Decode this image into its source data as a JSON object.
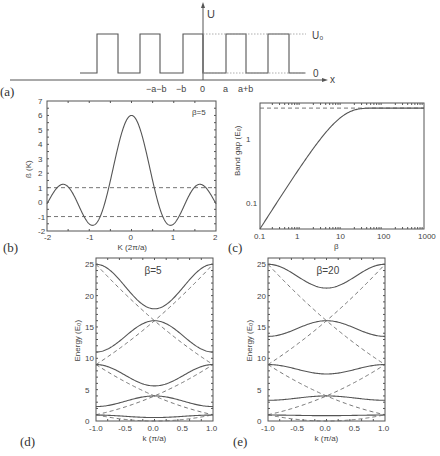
{
  "panels": {
    "a": {
      "label": "(a)",
      "y_axis_label": "U",
      "x_axis_label": "x",
      "level_high": "U₀",
      "level_low": "0",
      "x_ticks": [
        "−a−b",
        "−b",
        "0",
        "a",
        "a+b"
      ]
    },
    "b": {
      "label": "(b)"
    },
    "c": {
      "label": "(c)"
    },
    "d": {
      "label": "(d)"
    },
    "e": {
      "label": "(e)"
    }
  },
  "chart_data": [
    {
      "id": "a",
      "type": "line",
      "title": "",
      "description": "Periodic square-well (Kronig-Penney) potential U(x)",
      "xlabel": "x",
      "ylabel": "U",
      "x_ticks": [
        "-a-b",
        "-b",
        "0",
        "a",
        "a+b"
      ],
      "levels": {
        "low": "0",
        "high": "U0"
      }
    },
    {
      "id": "b",
      "type": "line",
      "annotation": "β=5",
      "xlabel": "K  (2π/a)",
      "ylabel": "ß (K)",
      "xlim": [
        -2,
        2
      ],
      "ylim": [
        -2,
        7
      ],
      "x_ticks": [
        "-2",
        "-1",
        "0",
        "1",
        "2"
      ],
      "y_ticks": [
        "-2",
        "-1",
        "0",
        "1",
        "2",
        "3",
        "4",
        "5",
        "6",
        "7"
      ],
      "hlines_dashed": [
        1,
        -1
      ],
      "x": [
        -2,
        -1.75,
        -1.55,
        -1.35,
        -1.1,
        -0.85,
        -0.62,
        -0.4,
        -0.2,
        0,
        0.2,
        0.4,
        0.62,
        0.85,
        1.1,
        1.35,
        1.55,
        1.75,
        2
      ],
      "y": [
        1.0,
        -0.5,
        -1.1,
        -0.4,
        1.25,
        -0.5,
        -1.6,
        0.6,
        4.1,
        6.0,
        4.1,
        0.6,
        -1.6,
        -0.5,
        1.25,
        -0.4,
        -1.1,
        -0.5,
        1.0
      ]
    },
    {
      "id": "c",
      "type": "line",
      "xscale": "log",
      "yscale": "log",
      "xlabel": "β",
      "ylabel": "Band gap (E₀)",
      "xlim": [
        0.1,
        1000
      ],
      "ylim": [
        0.04,
        3.6
      ],
      "x_ticks": [
        "0.1",
        "1",
        "10",
        "100",
        "1000"
      ],
      "y_ticks": [
        "0.1",
        "1"
      ],
      "hline_dashed": 3.0,
      "x": [
        0.1,
        0.2,
        0.5,
        1,
        2,
        5,
        10,
        20,
        50,
        100,
        200,
        1000
      ],
      "y": [
        0.04,
        0.08,
        0.2,
        0.4,
        0.75,
        1.4,
        2.0,
        2.5,
        2.85,
        2.95,
        2.98,
        3.0
      ]
    },
    {
      "id": "d",
      "type": "line",
      "annotation": "β=5",
      "xlabel": "k  (π/a)",
      "ylabel": "Energy (E₀)",
      "xlim": [
        -1,
        1
      ],
      "ylim": [
        0,
        26
      ],
      "x_ticks": [
        "-1.0",
        "-0.5",
        "0.0",
        "0.5",
        "1.0"
      ],
      "y_ticks": [
        "0",
        "5",
        "10",
        "15",
        "20",
        "25"
      ],
      "bands_solid": [
        {
          "name": "band1",
          "E_edge": 0.95,
          "E_center": 0.55
        },
        {
          "name": "band2",
          "E_edge": 2.3,
          "E_center": 4.0
        },
        {
          "name": "band3",
          "E_edge": 9.0,
          "E_center": 5.6
        },
        {
          "name": "band4",
          "E_edge": 11.0,
          "E_center": 16.0
        },
        {
          "name": "band5",
          "E_edge": 25.0,
          "E_center": 17.9
        }
      ],
      "free_electron_dashed": "E = n^2 (k + 2m)^2 parabolas, crossings at 1, 4, 9, 16, 25"
    },
    {
      "id": "e",
      "type": "line",
      "annotation": "β=20",
      "xlabel": "k  (π/a)",
      "ylabel": "Energy (E₀)",
      "xlim": [
        -1,
        1
      ],
      "ylim": [
        0,
        26
      ],
      "x_ticks": [
        "-1.0",
        "-0.5",
        "0.0",
        "0.5",
        "1.0"
      ],
      "y_ticks": [
        "0",
        "5",
        "10",
        "15",
        "20",
        "25"
      ],
      "bands_solid": [
        {
          "name": "band1",
          "E_edge": 0.95,
          "E_center": 0.85
        },
        {
          "name": "band2",
          "E_edge": 3.3,
          "E_center": 4.0
        },
        {
          "name": "band3",
          "E_edge": 9.0,
          "E_center": 7.5
        },
        {
          "name": "band4",
          "E_edge": 13.5,
          "E_center": 16.0
        },
        {
          "name": "band5",
          "E_edge": 25.0,
          "E_center": 21.2
        }
      ],
      "free_electron_dashed": "E = (k + 2m)^2 parabolas, crossings at 1, 4, 9, 16, 25"
    }
  ]
}
